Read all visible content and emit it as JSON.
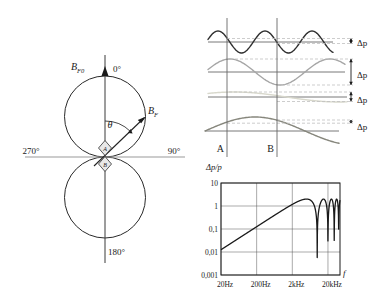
{
  "figure": {
    "description_colors": {
      "ink": "#1a1a1a",
      "grid": "#555555",
      "axis_gray": "#999999",
      "dash": "#c0c0c0",
      "diamond_fill": "#e8e8e8"
    }
  },
  "polar": {
    "axis_vector_label": {
      "main": "B",
      "sub": "F0"
    },
    "vector_label": {
      "main": "B",
      "sub": "F"
    },
    "theta_label": "θ",
    "angle_top": "0°",
    "angle_right": "90°",
    "angle_bottom": "180°",
    "angle_left": "270°",
    "mic_front_label": "A",
    "mic_back_label": "B"
  },
  "waves_panel": {
    "point_a_label": "A",
    "point_b_label": "B",
    "delta_label": "Δp",
    "line_a_x": 38,
    "line_b_x": 88,
    "lines_y_top": 18,
    "lines_y_bottom": 157,
    "label_y": 152,
    "delta_label_x": 168,
    "arrow_x": 162,
    "rows": [
      {
        "name": "high-frequency-wave",
        "color": "#2f2f2f",
        "stroke_width": 1.4,
        "baseline": 42,
        "amplitude": 11,
        "period": 47,
        "peak_x": 29,
        "x_start": 19,
        "x_end": 144,
        "dash_top": 38.5,
        "dash_bottom": 43.5,
        "dash_top_start": 38,
        "dash_bottom_start": 88,
        "label_y": 46
      },
      {
        "name": "mid-frequency-wave",
        "color": "#a6a6a6",
        "stroke_width": 1.4,
        "baseline": 72,
        "amplitude": 13,
        "period": 100,
        "peak_x": 41,
        "x_start": 19,
        "x_end": 156,
        "dash_top": 59,
        "dash_bottom": 85,
        "dash_top_start": 41,
        "dash_bottom_start": 88,
        "label_y": 78
      },
      {
        "name": "low-amplitude-wave",
        "color": "#d8d8cc",
        "stroke_width": 1.4,
        "baseline": 97,
        "amplitude": 5,
        "period": 210,
        "peak_x": 45,
        "x_start": 19,
        "x_end": 158,
        "dash_top": 92,
        "dash_bottom": 101.5,
        "dash_top_start": 40,
        "dash_bottom_start": 88,
        "label_y": 103
      },
      {
        "name": "low-frequency-wave",
        "color": "#86867c",
        "stroke_width": 1.4,
        "baseline": 131,
        "amplitude": 14,
        "period": 200,
        "peak_x": 66,
        "x_start": 16,
        "x_end": 150,
        "dash_top": 120,
        "dash_bottom": 123.2,
        "dash_top_start": 88,
        "dash_bottom_start": 38,
        "label_y": 130
      }
    ]
  },
  "chart_data": {
    "type": "line",
    "title": "Δp/p",
    "ylabel": "Δp/p",
    "xlabel": "f",
    "x_scale": "log",
    "y_scale": "log",
    "xlim": [
      20,
      43500
    ],
    "ylim": [
      0.001,
      10
    ],
    "x_ticks": [
      "20Hz",
      "200Hz",
      "2kHz",
      "20kHz"
    ],
    "x_tick_values": [
      20,
      200,
      2000,
      20000
    ],
    "y_ticks": [
      "10",
      "1",
      "0,1",
      "0,01",
      "0,001"
    ],
    "y_tick_values": [
      10,
      1,
      0.1,
      0.01,
      0.001
    ],
    "grid": true,
    "curve": {
      "formula": "dp_over_p = peak * abs(sin(pi * f / first_notch_freq))",
      "peak": 2,
      "first_notch_freq": 10000,
      "notch_freqs": [
        10000,
        20000,
        30000,
        40000
      ],
      "points": [
        [
          20,
          0.013
        ],
        [
          200,
          0.126
        ],
        [
          2000,
          1.18
        ],
        [
          5000,
          2.0
        ],
        [
          10000,
          0.001
        ],
        [
          15000,
          2.0
        ],
        [
          20000,
          0.001
        ],
        [
          25000,
          2.0
        ],
        [
          30000,
          0.001
        ],
        [
          35000,
          2.0
        ],
        [
          40000,
          0.001
        ],
        [
          43500,
          0.5
        ]
      ]
    }
  }
}
